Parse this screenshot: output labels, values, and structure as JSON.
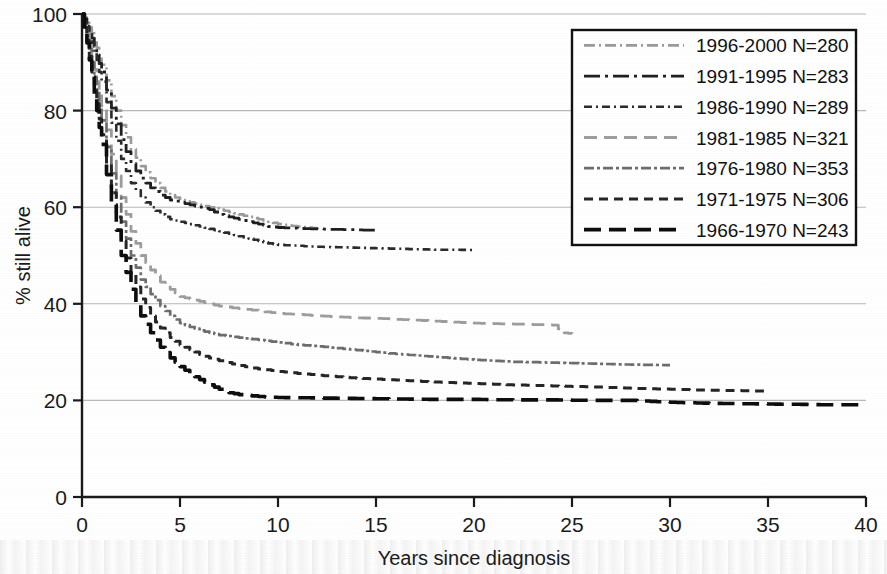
{
  "chart_data": {
    "type": "line",
    "title": "",
    "subtitle": "",
    "xlabel": "Years since diagnosis",
    "ylabel": "% still alive",
    "xlim": [
      0,
      40
    ],
    "ylim": [
      0,
      100
    ],
    "xticks": [
      "0",
      "5",
      "10",
      "15",
      "20",
      "25",
      "30",
      "35",
      "40"
    ],
    "yticks": [
      "0",
      "20",
      "40",
      "60",
      "80",
      "100"
    ],
    "grid": "horizontal",
    "legend_position": "top-right",
    "annotations": [],
    "series": [
      {
        "name": "1996-2000 N=280",
        "period": "1996-2000",
        "n": 280,
        "style": "dash-dot-light",
        "color": "#9a9a9a",
        "dasharray": "11,4,2,4",
        "width": 2.6,
        "x": [
          0,
          0.25,
          0.5,
          0.75,
          1,
          1.5,
          2,
          2.5,
          3,
          3.5,
          4,
          4.5,
          5,
          5.5,
          6,
          6.5,
          7,
          7.5,
          8,
          8.5,
          9,
          9.5,
          10,
          10.5,
          11,
          11.5,
          12
        ],
        "y": [
          100,
          98.5,
          96,
          93,
          89.5,
          83,
          77,
          72,
          68.5,
          66,
          64,
          62.5,
          61.5,
          61,
          60.5,
          60,
          59.5,
          59,
          58.5,
          58,
          57.5,
          57,
          56.5,
          56.2,
          56,
          55.8,
          55.6
        ]
      },
      {
        "name": "1991-1995 N=283",
        "period": "1991-1995",
        "n": 283,
        "style": "long-dash-dot-dark",
        "color": "#1f1f1f",
        "dasharray": "16,5,3,5",
        "width": 2.8,
        "x": [
          0,
          0.25,
          0.5,
          0.75,
          1,
          1.5,
          2,
          2.5,
          3,
          3.5,
          4,
          4.5,
          5,
          5.5,
          6,
          6.5,
          7,
          7.5,
          8,
          8.5,
          9,
          9.5,
          10,
          11,
          12,
          13,
          14,
          15
        ],
        "y": [
          100,
          98,
          95,
          91.5,
          88,
          80.5,
          74,
          69,
          66,
          64,
          62.5,
          61.5,
          61,
          60.5,
          60,
          59.5,
          58.5,
          58,
          57.5,
          57,
          56.5,
          56,
          55.8,
          55.6,
          55.5,
          55.4,
          55.3,
          55.2
        ]
      },
      {
        "name": "1986-1990 N=289",
        "period": "1986-1990",
        "n": 289,
        "style": "dash-dot-medium",
        "color": "#2b2b2b",
        "dasharray": "8,4,2,4",
        "width": 2.6,
        "x": [
          0,
          0.25,
          0.5,
          0.75,
          1,
          1.5,
          2,
          2.5,
          3,
          3.5,
          4,
          4.5,
          5,
          5.5,
          6,
          6.5,
          7,
          7.5,
          8,
          8.5,
          9,
          9.5,
          10,
          11,
          12,
          13,
          14,
          15,
          16,
          17,
          18,
          19,
          20
        ],
        "y": [
          100,
          97.5,
          94,
          90,
          86,
          77.5,
          70,
          65,
          62,
          60,
          58.5,
          57.5,
          57,
          56.5,
          56,
          55.5,
          55,
          54.5,
          54,
          53.5,
          53,
          52.5,
          52.2,
          52,
          51.8,
          51.7,
          51.6,
          51.5,
          51.4,
          51.3,
          51.2,
          51.2,
          51.1
        ]
      },
      {
        "name": "1981-1985 N=321",
        "period": "1981-1985",
        "n": 321,
        "style": "long-dash-light",
        "color": "#9d9d9d",
        "dasharray": "13,7",
        "width": 2.8,
        "x": [
          0,
          0.25,
          0.5,
          0.75,
          1,
          1.5,
          2,
          2.5,
          3,
          3.5,
          4,
          4.5,
          5,
          5.5,
          6,
          6.5,
          7,
          8,
          9,
          10,
          11,
          12,
          13,
          14,
          15,
          16,
          17,
          18,
          19,
          20,
          21,
          22,
          23,
          24,
          24.6,
          25
        ],
        "y": [
          100,
          96,
          91,
          86,
          81,
          71,
          62,
          55,
          50,
          47,
          44.5,
          43,
          41.5,
          41,
          40.5,
          40,
          39.5,
          39,
          38.5,
          38,
          37.8,
          37.5,
          37.3,
          37.1,
          37,
          36.8,
          36.6,
          36.4,
          36.2,
          36,
          35.9,
          35.8,
          35.7,
          35.6,
          34,
          33.8
        ]
      },
      {
        "name": "1976-1980 N=353",
        "period": "1976-1980",
        "n": 353,
        "style": "dash-dot-gray",
        "color": "#6d6d6d",
        "dasharray": "10,3,3,3",
        "width": 2.7,
        "x": [
          0,
          0.25,
          0.5,
          0.75,
          1,
          1.5,
          2,
          2.5,
          3,
          3.5,
          4,
          4.5,
          5,
          5.5,
          6,
          6.5,
          7,
          8,
          9,
          10,
          11,
          12,
          13,
          14,
          15,
          16,
          17,
          18,
          19,
          20,
          22,
          24,
          26,
          28,
          30
        ],
        "y": [
          100,
          95.5,
          90,
          84,
          78,
          67,
          57,
          50,
          45,
          42,
          39.5,
          37.5,
          36,
          35.2,
          34.5,
          34,
          33.5,
          33,
          32.5,
          32,
          31.5,
          31.2,
          30.8,
          30.4,
          30,
          29.6,
          29.3,
          29,
          28.7,
          28.4,
          28,
          27.8,
          27.6,
          27.4,
          27.3
        ]
      },
      {
        "name": "1971-1975 N=306",
        "period": "1971-1975",
        "n": 306,
        "style": "medium-dash-dark",
        "color": "#252525",
        "dasharray": "9,6",
        "width": 3.0,
        "x": [
          0,
          0.25,
          0.5,
          0.75,
          1,
          1.5,
          2,
          2.5,
          3,
          3.5,
          4,
          4.5,
          5,
          5.5,
          6,
          6.5,
          7,
          8,
          9,
          10,
          12,
          14,
          16,
          18,
          20,
          22,
          24,
          26,
          28,
          30,
          32,
          34,
          35
        ],
        "y": [
          100,
          94.5,
          88,
          81.5,
          75,
          63,
          53,
          46,
          41,
          37.5,
          35,
          33,
          31.5,
          30.5,
          29.5,
          28.8,
          28.2,
          27.2,
          26.5,
          26,
          25.2,
          24.6,
          24.2,
          23.8,
          23.5,
          23.2,
          23,
          22.8,
          22.5,
          22.3,
          22.1,
          22,
          21.9
        ]
      },
      {
        "name": "1966-1970 N=243",
        "period": "1966-1970",
        "n": 243,
        "style": "long-dash-black",
        "color": "#0d0d0d",
        "dasharray": "17,8",
        "width": 3.6,
        "x": [
          0,
          0.25,
          0.5,
          0.75,
          1,
          1.5,
          2,
          2.5,
          3,
          3.5,
          4,
          4.5,
          5,
          5.5,
          6,
          6.5,
          7,
          7.5,
          8,
          9,
          10,
          12,
          14,
          16,
          18,
          20,
          22,
          24,
          26,
          28,
          30,
          32,
          34,
          36,
          38,
          40
        ],
        "y": [
          100,
          94,
          87,
          80,
          73,
          60.5,
          50,
          43,
          37.5,
          34,
          31,
          28.8,
          27,
          25.5,
          24.3,
          23.2,
          22.3,
          21.6,
          21.2,
          20.8,
          20.6,
          20.5,
          20.4,
          20.3,
          20.2,
          20.2,
          20.1,
          20.1,
          20,
          20,
          19.6,
          19.4,
          19.3,
          19.2,
          19.1,
          19.1
        ]
      }
    ]
  },
  "legend": {
    "items": [
      {
        "label": "1996-2000 N=280"
      },
      {
        "label": "1991-1995 N=283"
      },
      {
        "label": "1986-1990 N=289"
      },
      {
        "label": "1981-1985 N=321"
      },
      {
        "label": "1976-1980 N=353"
      },
      {
        "label": "1971-1975 N=306"
      },
      {
        "label": "1966-1970 N=243"
      }
    ]
  }
}
